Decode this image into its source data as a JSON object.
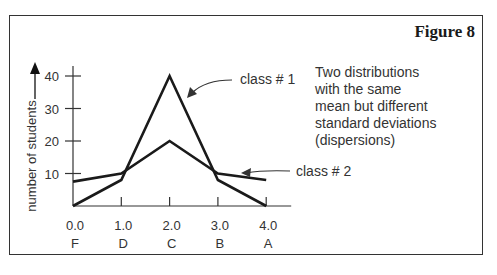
{
  "figure": {
    "title": "Figure 8",
    "description_lines": [
      "Two distributions",
      "with the same",
      "mean but different",
      "standard deviations",
      "(dispersions)"
    ]
  },
  "chart_data": {
    "type": "line",
    "title": "Figure 8",
    "xlabel": "",
    "ylabel": "number of students",
    "x": [
      0.0,
      1.0,
      2.0,
      3.0,
      4.0
    ],
    "x_tick_labels": [
      "0.0",
      "1.0",
      "2.0",
      "3.0",
      "4.0"
    ],
    "x_grade_labels": [
      "F",
      "D",
      "C",
      "B",
      "A"
    ],
    "y_ticks": [
      10,
      20,
      30,
      40
    ],
    "ylim": [
      0,
      40
    ],
    "grid": false,
    "series": [
      {
        "name": "class # 1",
        "values": [
          0,
          8,
          40,
          8,
          0
        ]
      },
      {
        "name": "class # 2",
        "values": [
          7.5,
          10,
          20,
          10,
          8
        ]
      }
    ],
    "annotations": [
      "class # 1",
      "class # 2"
    ],
    "description": "Two distributions with the same mean but different standard deviations (dispersions)"
  }
}
